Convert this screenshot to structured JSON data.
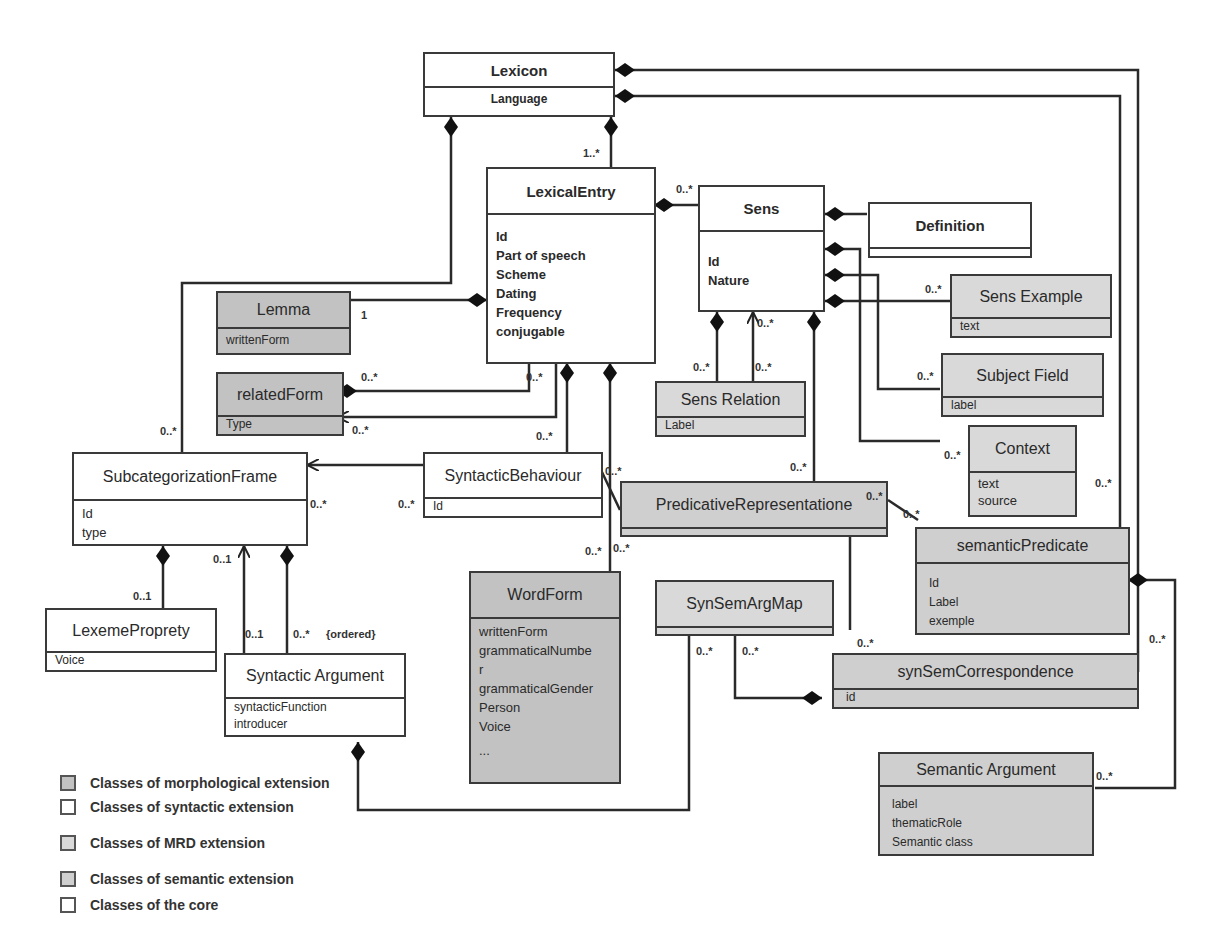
{
  "classes": {
    "lexicon": {
      "name": "Lexicon",
      "attrs": [
        "Language"
      ]
    },
    "lexical_entry": {
      "name": "LexicalEntry",
      "attrs": [
        "Id",
        "Part of speech",
        "Scheme",
        "Dating",
        "Frequency",
        "conjugable"
      ]
    },
    "sens": {
      "name": "Sens",
      "attrs": [
        "Id",
        "Nature"
      ]
    },
    "definition": {
      "name": "Definition",
      "attrs": []
    },
    "sens_example": {
      "name": "Sens Example",
      "attrs": [
        "text"
      ]
    },
    "subject_field": {
      "name": "Subject Field",
      "attrs": [
        "label"
      ]
    },
    "context": {
      "name": "Context",
      "attrs": [
        "text",
        "source"
      ]
    },
    "lemma": {
      "name": "Lemma",
      "attrs": [
        "writtenForm"
      ]
    },
    "related_form": {
      "name": "relatedForm",
      "attrs": [
        "Type"
      ]
    },
    "sens_relation": {
      "name": "Sens Relation",
      "attrs": [
        "Label"
      ]
    },
    "subcategorization_frame": {
      "name": "SubcategorizationFrame",
      "attrs": [
        "Id",
        "type"
      ]
    },
    "syntactic_behaviour": {
      "name": "SyntacticBehaviour",
      "attrs": [
        "Id"
      ]
    },
    "predicative_representation": {
      "name": "PredicativeRepresentatione",
      "attrs": []
    },
    "semantic_predicate": {
      "name": "semanticPredicate",
      "attrs": [
        "Id",
        "Label",
        "exemple"
      ]
    },
    "lexeme_property": {
      "name": "LexemeProprety",
      "attrs": [
        "Voice"
      ]
    },
    "syntactic_argument": {
      "name": "Syntactic Argument",
      "attrs": [
        "syntacticFunction",
        "introducer"
      ]
    },
    "word_form": {
      "name": "WordForm",
      "attrs": [
        "writtenForm",
        "grammaticalNumbe",
        "r",
        "grammaticalGender",
        "Person",
        "Voice",
        "..."
      ]
    },
    "syn_sem_arg_map": {
      "name": "SynSemArgMap",
      "attrs": []
    },
    "syn_sem_correspondence": {
      "name": "synSemCorrespondence",
      "attrs": [
        "id"
      ]
    },
    "semantic_argument": {
      "name": "Semantic Argument",
      "attrs": [
        "label",
        "thematicRole",
        "Semantic class"
      ]
    }
  },
  "multiplicities": {
    "lexicon_entry": "1..*",
    "entry_sens": "0..*",
    "lemma": "1",
    "related_form_top": "0..*",
    "related_form_bottom": "0..*",
    "entry_arrow": "0..*",
    "subcat_top": "0..*",
    "subcat_right": "0..*",
    "synbeh_left": "0..*",
    "synbeh_top": "0..*",
    "synbeh_pred": "0..*",
    "wordform_left": "0..*",
    "wordform_right": "0..*",
    "sensrel_left": "0..*",
    "sensrel_right": "0..*",
    "sensrel_arrow": "0..*",
    "sens_pred": "0..*",
    "sens_example": "0..*",
    "subject_field": "0..*",
    "context": "0..*",
    "lexicon_right": "0..*",
    "pred_sem_a": "0..*",
    "pred_sem_b": "0..*",
    "lexeme_prop": "0..1",
    "subcat_arrow": "0..1",
    "synarg_a": "0..1",
    "synarg_b": "0..*",
    "ordered": "{ordered}",
    "ssam_a": "0..*",
    "ssam_b": "0..*",
    "ssc_top": "0..*",
    "semarg_right": "0..*",
    "sempred_right": "0..*"
  },
  "legend": [
    {
      "label": "Classes of morphological extension",
      "color": "#c2c2c2"
    },
    {
      "label": "Classes of syntactic extension",
      "color": "#ffffff"
    },
    {
      "label": "Classes of MRD extension",
      "color": "#d9d9d9"
    },
    {
      "label": "Classes of semantic extension",
      "color": "#cfcfcf"
    },
    {
      "label": "Classes of  the core",
      "color": "#ffffff"
    }
  ]
}
